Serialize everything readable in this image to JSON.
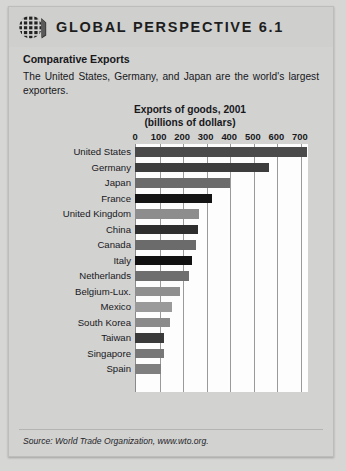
{
  "header": {
    "logo_icon": "globe-grid-icon",
    "title": "GLOBAL PERSPECTIVE 6.1"
  },
  "article": {
    "subtitle": "Comparative Exports",
    "intro": "The United States, Germany, and Japan are the world's largest exporters."
  },
  "source": {
    "text": "Source: World Trade Organization, www.wto.org."
  },
  "chart_data": {
    "type": "bar",
    "orientation": "horizontal",
    "title": "Exports of goods, 2001",
    "subtitle": "(billions of dollars)",
    "xlabel": "",
    "ylabel": "",
    "xlim": [
      0,
      730
    ],
    "ticks": [
      0,
      100,
      200,
      300,
      400,
      500,
      600,
      700
    ],
    "tick_labels": [
      "0",
      "100",
      "200",
      "300",
      "400",
      "500",
      "600",
      "700"
    ],
    "grid": true,
    "legend": "none",
    "categories": [
      "United States",
      "Germany",
      "Japan",
      "France",
      "United Kingdom",
      "China",
      "Canada",
      "Italy",
      "Netherlands",
      "Belgium-Lux.",
      "Mexico",
      "South Korea",
      "Taiwan",
      "Singapore",
      "Spain"
    ],
    "values": [
      730,
      570,
      405,
      325,
      270,
      266,
      260,
      244,
      230,
      190,
      158,
      150,
      123,
      122,
      110
    ],
    "bar_colors": [
      "#4a4a4a",
      "#3d3d3d",
      "#6b6b6b",
      "#141414",
      "#8d8d8d",
      "#2e2e2e",
      "#6b6b6b",
      "#111111",
      "#6e6e6e",
      "#8f8f8f",
      "#9a9a9a",
      "#8a8a8a",
      "#3a3a3a",
      "#777777",
      "#7f7f7f"
    ]
  },
  "colors": {
    "page_background": "#d6d6d4",
    "card_background": "#d2d2d0",
    "plot_background": "#fdfdfd",
    "text": "#18181c",
    "gridline": "#9a9a9a"
  }
}
